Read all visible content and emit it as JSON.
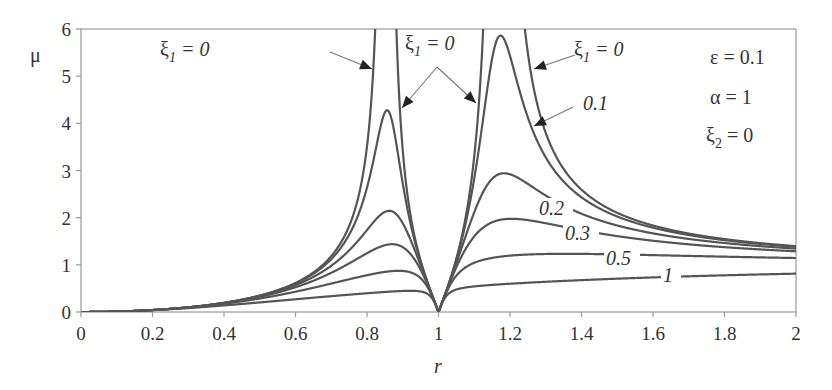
{
  "chart_data": {
    "type": "line",
    "title": "",
    "xlabel": "r",
    "ylabel": "μ",
    "xlim": [
      0,
      2
    ],
    "ylim": [
      0,
      6
    ],
    "xticks": [
      "0",
      "0.2",
      "0.4",
      "0.6",
      "0.8",
      "1",
      "1.2",
      "1.4",
      "1.6",
      "1.8",
      "2"
    ],
    "yticks": [
      "0",
      "1",
      "2",
      "3",
      "4",
      "5",
      "6"
    ],
    "grid": false,
    "parameters": {
      "epsilon": 0.1,
      "alpha": 1,
      "xi2": 0
    },
    "annotations": [
      "ε = 0.1",
      "α = 1",
      "ξ2 = 0"
    ],
    "series": [
      {
        "name": "ξ1 = 0",
        "xi1": 0,
        "peaks": [
          {
            "r": 0.85,
            "mu": ">6"
          },
          {
            "r": 1.17,
            "mu": ">6"
          }
        ],
        "label": "ξ1 = 0"
      },
      {
        "name": "ξ1 = 0.1",
        "xi1": 0.1,
        "peaks": [
          {
            "r": 0.86,
            "mu": 4.3
          },
          {
            "r": 1.18,
            "mu": 5.85
          }
        ],
        "label": "0.1"
      },
      {
        "name": "ξ1 = 0.2",
        "xi1": 0.2,
        "peaks": [
          {
            "r": 0.86,
            "mu": 2.15
          },
          {
            "r": 1.18,
            "mu": 2.95
          }
        ],
        "label": "0.2"
      },
      {
        "name": "ξ1 = 0.3",
        "xi1": 0.3,
        "peaks": [
          {
            "r": 0.87,
            "mu": 1.45
          },
          {
            "r": 1.2,
            "mu": 1.97
          }
        ],
        "label": "0.3"
      },
      {
        "name": "ξ1 = 0.5",
        "xi1": 0.5,
        "peaks": [
          {
            "r": 0.9,
            "mu": 0.87
          },
          {
            "r": 1.4,
            "mu": 1.25
          }
        ],
        "label": "0.5"
      },
      {
        "name": "ξ1 = 1",
        "xi1": 1,
        "values_at_r2": 0.81,
        "label": "1"
      }
    ],
    "note": "All curves go to μ=0 at r=1 (antiresonance); approach ~1.2–1.35 at r=2"
  },
  "labels": {
    "ylabel": "μ",
    "xlabel": "r",
    "xi1_zero_left": "ξ",
    "xi1_zero_sub": "1",
    "xi1_zero_eq": " = 0",
    "xi1_label_0_1": "0.1",
    "xi1_label_0_2": "0.2",
    "xi1_label_0_3": "0.3",
    "xi1_label_0_5": "0.5",
    "xi1_label_1": "1",
    "param_eps": "ε = 0.1",
    "param_alpha": "α = 1",
    "param_xi2_sym": "ξ",
    "param_xi2_sub": "2",
    "param_xi2_eq": " = 0"
  },
  "colors": {
    "curve": "#555555",
    "axis": "#999999",
    "text": "#333333"
  }
}
